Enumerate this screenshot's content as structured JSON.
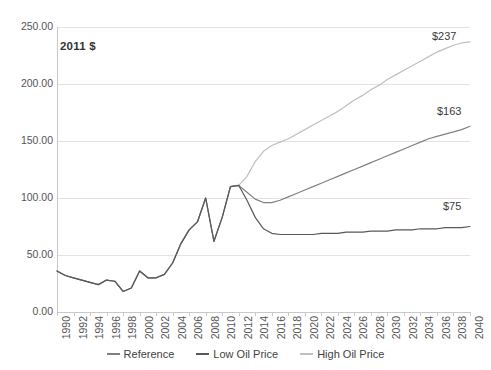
{
  "chart_data": {
    "type": "line",
    "title": "",
    "subtitle": "",
    "annotation": "2011 $",
    "xlabel": "",
    "ylabel": "",
    "xlim": [
      1990,
      2040
    ],
    "ylim": [
      0,
      250
    ],
    "ytick_step": 50,
    "xtick_step": 2,
    "grid": true,
    "legend_position": "bottom-center",
    "ytick_labels": [
      "0.00",
      "50.00",
      "100.00",
      "150.00",
      "200.00",
      "250.00"
    ],
    "ytick_values": [
      0,
      50,
      100,
      150,
      200,
      250
    ],
    "xtick_labels": [
      "1990",
      "1992",
      "1994",
      "1996",
      "1998",
      "2000",
      "2002",
      "2004",
      "2006",
      "2008",
      "2010",
      "2012",
      "2014",
      "2016",
      "2018",
      "2020",
      "2022",
      "2024",
      "2026",
      "2028",
      "2030",
      "2032",
      "2034",
      "2036",
      "2038",
      "2040"
    ],
    "x": [
      1990,
      1991,
      1992,
      1993,
      1994,
      1995,
      1996,
      1997,
      1998,
      1999,
      2000,
      2001,
      2002,
      2003,
      2004,
      2005,
      2006,
      2007,
      2008,
      2009,
      2010,
      2011,
      2012,
      2013,
      2014,
      2015,
      2016,
      2017,
      2018,
      2019,
      2020,
      2021,
      2022,
      2023,
      2024,
      2025,
      2026,
      2027,
      2028,
      2029,
      2030,
      2031,
      2032,
      2033,
      2034,
      2035,
      2036,
      2037,
      2038,
      2039,
      2040
    ],
    "series": [
      {
        "name": "Reference",
        "color": "#808080",
        "values": [
          36,
          32,
          30,
          28,
          26,
          24,
          28,
          27,
          18,
          21,
          36,
          30,
          30,
          33,
          43,
          60,
          72,
          79,
          100,
          62,
          83,
          110,
          111,
          105,
          99,
          96,
          96,
          98,
          101,
          104,
          107,
          110,
          113,
          116,
          119,
          122,
          125,
          128,
          131,
          134,
          137,
          140,
          143,
          146,
          149,
          152,
          154,
          156,
          158,
          160,
          163
        ],
        "end_label": "$163"
      },
      {
        "name": "Low Oil Price",
        "color": "#595959",
        "values": [
          36,
          32,
          30,
          28,
          26,
          24,
          28,
          27,
          18,
          21,
          36,
          30,
          30,
          33,
          43,
          60,
          72,
          79,
          100,
          62,
          83,
          110,
          111,
          98,
          83,
          73,
          69,
          68,
          68,
          68,
          68,
          68,
          69,
          69,
          69,
          70,
          70,
          70,
          71,
          71,
          71,
          72,
          72,
          72,
          73,
          73,
          73,
          74,
          74,
          74,
          75
        ],
        "end_label": "$75"
      },
      {
        "name": "High Oil Price",
        "color": "#bfbfbf",
        "values": [
          36,
          32,
          30,
          28,
          26,
          24,
          28,
          27,
          18,
          21,
          36,
          30,
          30,
          33,
          43,
          60,
          72,
          79,
          100,
          62,
          83,
          110,
          111,
          119,
          132,
          141,
          146,
          149,
          152,
          156,
          160,
          164,
          168,
          172,
          176,
          181,
          186,
          190,
          195,
          199,
          204,
          208,
          212,
          216,
          220,
          224,
          228,
          231,
          234,
          236,
          237
        ],
        "end_label": "$237"
      }
    ],
    "end_labels": [
      {
        "name": "high-oil-price-end-label",
        "text": "$237"
      },
      {
        "name": "reference-end-label",
        "text": "$163"
      },
      {
        "name": "low-oil-price-end-label",
        "text": "$75"
      }
    ],
    "legend": [
      {
        "label": "Reference",
        "color": "#808080"
      },
      {
        "label": "Low Oil Price",
        "color": "#595959"
      },
      {
        "label": "High Oil Price",
        "color": "#bfbfbf"
      }
    ]
  },
  "colors": {
    "gridline": "#e3e3e3",
    "axis": "#c9c9c9",
    "text": "#555555",
    "background": "#ffffff"
  }
}
